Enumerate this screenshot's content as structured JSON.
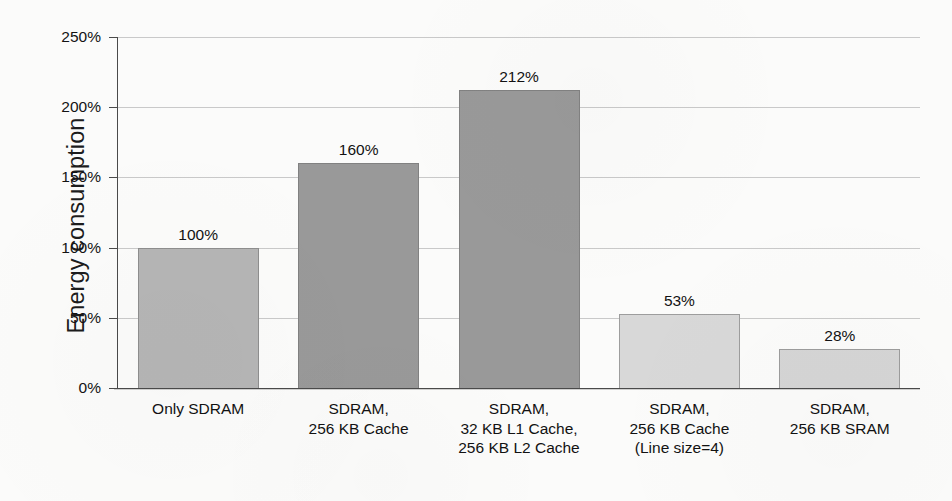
{
  "chart_data": {
    "type": "bar",
    "title": "",
    "subtitle": "",
    "xlabel": "",
    "ylabel": "Energy consumption",
    "ylim": [
      0,
      250
    ],
    "y_unit": "%",
    "grid": true,
    "legend": "none",
    "y_ticks": [
      "0%",
      "50%",
      "100%",
      "150%",
      "200%",
      "250%"
    ],
    "y_tick_values": [
      0,
      50,
      100,
      150,
      200,
      250
    ],
    "categories": [
      "Only SDRAM",
      "SDRAM,\n256 KB Cache",
      "SDRAM,\n32 KB L1 Cache,\n256 KB L2 Cache",
      "SDRAM,\n256 KB Cache\n(Line size=4)",
      "SDRAM,\n256 KB SRAM"
    ],
    "values": [
      100,
      160,
      212,
      53,
      28
    ],
    "data_labels": [
      "100%",
      "160%",
      "212%",
      "53%",
      "28%"
    ],
    "bar_colors": [
      "#b5b5b5",
      "#999999",
      "#999999",
      "#d8d8d8",
      "#d5d5d5"
    ]
  },
  "colors": {
    "background": "#fbfbfa",
    "axis": "#4a4a4a",
    "gridline": "#c9c9c9",
    "text": "#121212"
  }
}
